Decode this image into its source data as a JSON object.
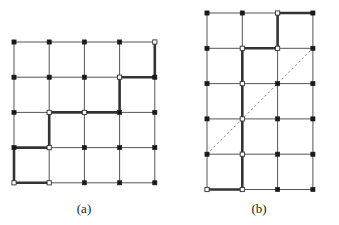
{
  "figure": {
    "background_color": "#ffffff",
    "line_color": "#555555",
    "bold_line_color": "#333333",
    "dash_color": "#888888",
    "node_fill_color": "#1a1a1a",
    "node_open_fill_color": "#ffffff",
    "thin_width": 1,
    "bold_width": 2.6
  },
  "panels": [
    {
      "id": "panel-a",
      "caption": "(a)",
      "caption_x": 84,
      "caption_y": 213,
      "grid": {
        "origin_x": 14,
        "origin_y": 42,
        "cell_w": 35.2,
        "cell_h": 35.2,
        "cols": 4,
        "rows": 4,
        "node_cols": 5,
        "node_rows": 5
      },
      "bold_edges": [
        {
          "x1": 4,
          "y1": 4,
          "x2": 4,
          "y2": 3
        },
        {
          "x1": 3,
          "y1": 3,
          "x2": 4,
          "y2": 3
        },
        {
          "x1": 3,
          "y1": 3,
          "x2": 3,
          "y2": 2
        },
        {
          "x1": 1,
          "y1": 2,
          "x2": 2,
          "y2": 2
        },
        {
          "x1": 2,
          "y1": 2,
          "x2": 3,
          "y2": 2
        },
        {
          "x1": 1,
          "y1": 2,
          "x2": 1,
          "y2": 1
        },
        {
          "x1": 0,
          "y1": 1,
          "x2": 1,
          "y2": 1
        },
        {
          "x1": 0,
          "y1": 1,
          "x2": 0,
          "y2": 0
        },
        {
          "x1": 0,
          "y1": 0,
          "x2": 1,
          "y2": 0
        }
      ],
      "open_nodes": [
        {
          "x": 4,
          "y": 4
        },
        {
          "x": 3,
          "y": 3
        },
        {
          "x": 2,
          "y": 2
        },
        {
          "x": 1,
          "y": 2
        },
        {
          "x": 1,
          "y": 1
        },
        {
          "x": 0,
          "y": 0
        },
        {
          "x": 1,
          "y": 0
        }
      ],
      "dashed_line": null
    },
    {
      "id": "panel-b",
      "caption": "(b)",
      "caption_x": 259,
      "caption_y": 213,
      "grid": {
        "origin_x": 207,
        "origin_y": 13,
        "cell_w": 35.3,
        "cell_h": 35.3,
        "cols": 3,
        "rows": 5,
        "node_cols": 4,
        "node_rows": 6
      },
      "bold_edges": [
        {
          "x1": 2,
          "y1": 5,
          "x2": 3,
          "y2": 5
        },
        {
          "x1": 2,
          "y1": 5,
          "x2": 2,
          "y2": 4
        },
        {
          "x1": 1,
          "y1": 4,
          "x2": 2,
          "y2": 4
        },
        {
          "x1": 1,
          "y1": 4,
          "x2": 1,
          "y2": 3
        },
        {
          "x1": 1,
          "y1": 3,
          "x2": 1,
          "y2": 2
        },
        {
          "x1": 1,
          "y1": 2,
          "x2": 1,
          "y2": 1
        },
        {
          "x1": 1,
          "y1": 1,
          "x2": 1,
          "y2": 0
        },
        {
          "x1": 0,
          "y1": 0,
          "x2": 1,
          "y2": 0
        }
      ],
      "open_nodes": [
        {
          "x": 2,
          "y": 5
        },
        {
          "x": 2,
          "y": 4
        },
        {
          "x": 1,
          "y": 4
        },
        {
          "x": 1,
          "y": 3
        },
        {
          "x": 1,
          "y": 2
        },
        {
          "x": 1,
          "y": 1
        },
        {
          "x": 1,
          "y": 0
        },
        {
          "x": 0,
          "y": 0
        }
      ],
      "dashed_line": {
        "from_x": 0,
        "from_y": 1,
        "to_x": 3,
        "to_y": 4
      }
    }
  ]
}
